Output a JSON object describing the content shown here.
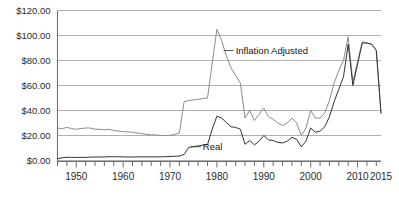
{
  "chart_data": {
    "type": "line",
    "title": "",
    "subtitle": "",
    "xlabel": "",
    "ylabel": "",
    "xlim": [
      1946,
      2015
    ],
    "ylim": [
      0,
      120
    ],
    "grid": true,
    "grid_axis": "y",
    "legend_position": "inline-annotations",
    "y_tick_labels": [
      "$0.00",
      "$20.00",
      "$40.00",
      "$60.00",
      "$80.00",
      "$100.00",
      "$120.00"
    ],
    "y_tick_values": [
      0,
      20,
      40,
      60,
      80,
      100,
      120
    ],
    "x_tick_labels": [
      "1950",
      "1960",
      "1970",
      "1980",
      "1990",
      "2000",
      "2010",
      "2015"
    ],
    "x_tick_values": [
      1950,
      1960,
      1970,
      1980,
      1990,
      2000,
      2010,
      2015
    ],
    "x_minor_tick_interval": 2,
    "annotations": [
      {
        "text": "Inflation Adjusted",
        "x": 1984,
        "y": 88,
        "series": "Inflation Adjusted"
      },
      {
        "text": "Real",
        "x": 1977,
        "y": 11,
        "series": "Real"
      }
    ],
    "x": [
      1946,
      1947,
      1948,
      1949,
      1950,
      1951,
      1952,
      1953,
      1954,
      1955,
      1956,
      1957,
      1958,
      1959,
      1960,
      1961,
      1962,
      1963,
      1964,
      1965,
      1966,
      1967,
      1968,
      1969,
      1970,
      1971,
      1972,
      1973,
      1974,
      1975,
      1976,
      1977,
      1978,
      1979,
      1980,
      1981,
      1982,
      1983,
      1984,
      1985,
      1986,
      1987,
      1988,
      1989,
      1990,
      1991,
      1992,
      1993,
      1994,
      1995,
      1996,
      1997,
      1998,
      1999,
      2000,
      2001,
      2002,
      2003,
      2004,
      2005,
      2006,
      2007,
      2008,
      2009,
      2010,
      2011,
      2012,
      2013,
      2014,
      2015
    ],
    "series": [
      {
        "name": "Inflation Adjusted",
        "color": "#8c8c8c",
        "values": [
          26.0,
          25.5,
          26.5,
          25.5,
          25.0,
          25.5,
          26.0,
          26.0,
          25.0,
          25.0,
          24.5,
          25.0,
          24.0,
          23.5,
          23.0,
          23.0,
          22.5,
          22.0,
          21.5,
          21.0,
          20.5,
          20.5,
          20.0,
          20.0,
          20.0,
          21.0,
          22.0,
          47.0,
          48.0,
          48.5,
          49.0,
          49.5,
          50.0,
          78.0,
          105.0,
          96.0,
          84.0,
          74.0,
          68.0,
          62.0,
          34.0,
          40.0,
          32.0,
          37.0,
          42.0,
          35.0,
          33.0,
          30.0,
          28.0,
          30.0,
          34.0,
          30.0,
          20.0,
          26.0,
          40.0,
          34.0,
          34.0,
          38.0,
          48.0,
          62.0,
          72.0,
          80.0,
          99.0,
          63.0,
          79.0,
          95.0,
          94.0,
          93.0,
          88.0,
          38.0
        ]
      },
      {
        "name": "Real",
        "color": "#333333",
        "values": [
          1.4,
          2.2,
          2.6,
          2.5,
          2.5,
          2.5,
          2.5,
          2.7,
          2.8,
          2.8,
          2.8,
          3.1,
          3.0,
          3.0,
          2.9,
          2.8,
          2.8,
          2.9,
          2.9,
          2.9,
          2.9,
          2.9,
          2.9,
          3.1,
          3.2,
          3.4,
          3.6,
          4.8,
          10.5,
          11.2,
          11.6,
          12.4,
          12.7,
          25.1,
          35.5,
          34.0,
          30.5,
          27.0,
          26.5,
          25.0,
          13.0,
          16.0,
          12.5,
          15.5,
          20.0,
          16.5,
          16.0,
          14.5,
          14.0,
          15.5,
          18.5,
          17.0,
          11.0,
          15.5,
          26.0,
          22.5,
          23.5,
          27.0,
          35.0,
          47.0,
          57.0,
          67.0,
          93.0,
          60.0,
          77.0,
          94.0,
          94.0,
          93.0,
          88.0,
          38.0
        ]
      }
    ]
  }
}
